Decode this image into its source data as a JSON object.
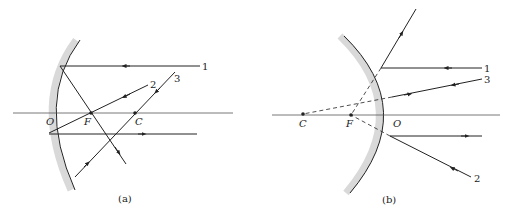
{
  "panel_a": {
    "caption": "(a)",
    "points": {
      "O": "O",
      "F": "F",
      "C": "C"
    },
    "rays": [
      "1",
      "2",
      "3"
    ],
    "mirror_type": "concave"
  },
  "panel_b": {
    "caption": "(b)",
    "points": {
      "C": "C",
      "F": "F",
      "O": "O"
    },
    "rays": [
      "1",
      "2",
      "3"
    ],
    "mirror_type": "convex"
  },
  "colors": {
    "line": "#222222",
    "mirror_shade": "#d9d9d9",
    "axis": "#555555"
  }
}
